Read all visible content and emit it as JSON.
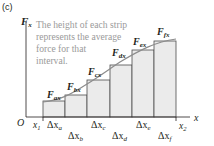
{
  "panel_label": "(c)",
  "axes": {
    "y_label": "F",
    "y_label_sub": "x",
    "x_label": "x",
    "origin_label": "O",
    "x_start_label": "x",
    "x_start_sub": "1",
    "x_end_label": "x",
    "x_end_sub": "2"
  },
  "annotation": {
    "lines": [
      "The height of each strip",
      "represents the average",
      "force for that",
      "interval."
    ]
  },
  "strips": [
    {
      "force_label": "F",
      "force_sub": "ax",
      "delta": "Δx",
      "delta_sub": "a",
      "height_px": 16
    },
    {
      "force_label": "F",
      "force_sub": "bx",
      "delta": "Δx",
      "delta_sub": "b",
      "height_px": 22
    },
    {
      "force_label": "F",
      "force_sub": "cx",
      "delta": "Δx",
      "delta_sub": "c",
      "height_px": 37
    },
    {
      "force_label": "F",
      "force_sub": "dx",
      "delta": "Δx",
      "delta_sub": "d",
      "height_px": 52
    },
    {
      "force_label": "F",
      "force_sub": "ex",
      "delta": "Δx",
      "delta_sub": "e",
      "height_px": 67
    },
    {
      "force_label": "F",
      "force_sub": "fx",
      "delta": "Δx",
      "delta_sub": "f",
      "height_px": 76
    }
  ],
  "colors": {
    "strip_fill": "#ebebeb",
    "strip_stroke": "#4d4d4d",
    "curve": "#8c8c8c",
    "axis": "#231f20",
    "annotation_text": "#9a9a9a"
  }
}
